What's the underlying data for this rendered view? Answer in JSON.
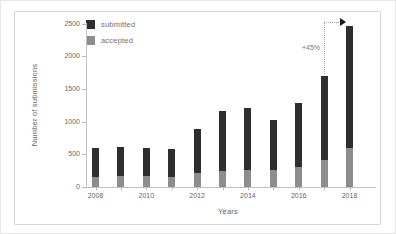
{
  "chart_data": {
    "type": "bar",
    "title": "",
    "xlabel": "Years",
    "ylabel": "Number of submissions",
    "categories": [
      "2008",
      "2009",
      "2010",
      "2011",
      "2012",
      "2013",
      "2014",
      "2015",
      "2016",
      "2017",
      "2018"
    ],
    "x_tick_labels": [
      "2008",
      "2010",
      "2012",
      "2014",
      "2016",
      "2018"
    ],
    "y_ticks": [
      0,
      500,
      1000,
      1500,
      2000,
      2500
    ],
    "ylim": [
      0,
      2500
    ],
    "bar_style": "overlay",
    "legend_position": "top-left",
    "series": [
      {
        "name": "submitted",
        "color": "#2e2e2e",
        "values": [
          600,
          615,
          600,
          585,
          880,
          1160,
          1210,
          1020,
          1290,
          1700,
          2465
        ]
      },
      {
        "name": "accepted",
        "color": "#8d8d8d",
        "values": [
          160,
          175,
          165,
          150,
          210,
          240,
          260,
          255,
          310,
          415,
          590
        ]
      }
    ],
    "annotation": {
      "label": "+45%",
      "from_year": "2017",
      "to_year": "2018"
    }
  },
  "style": {
    "figure_border_color": "#d6d6d6",
    "axis_line_color": "#c2c2c2",
    "tick_text_color": "#666666",
    "legend_text_color": "#707070",
    "annotation_text_color": "#777777",
    "arrow_color": "#1a1a1a",
    "background": "#ffffff"
  }
}
